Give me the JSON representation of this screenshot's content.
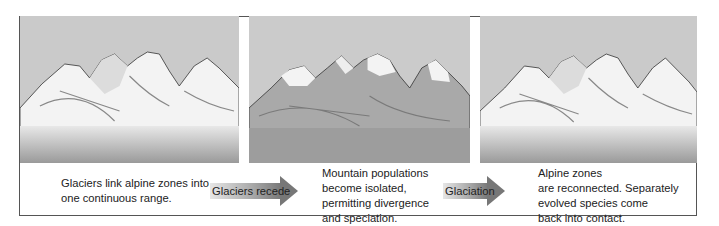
{
  "diagram": {
    "panels": [
      {
        "id": "glaciated",
        "state": "snow-covered continuous alpine range",
        "caption_lines": [
          "Glaciers link alpine zones into",
          "one continuous range."
        ]
      },
      {
        "id": "interglacial",
        "state": "snow only on peaks; isolated alpine zones",
        "caption_lines": [
          "Mountain populations",
          "become isolated,",
          "permitting divergence",
          "and speciation."
        ]
      },
      {
        "id": "reglaciated",
        "state": "snow-covered reconnected range",
        "caption_lines": [
          "Alpine zones",
          "are reconnected. Separately",
          "evolved species come",
          "back into contact."
        ]
      }
    ],
    "arrows": [
      {
        "label": "Glaciers recede",
        "icon": "right-arrow-icon"
      },
      {
        "label": "Glaciation",
        "icon": "right-arrow-icon"
      }
    ]
  }
}
